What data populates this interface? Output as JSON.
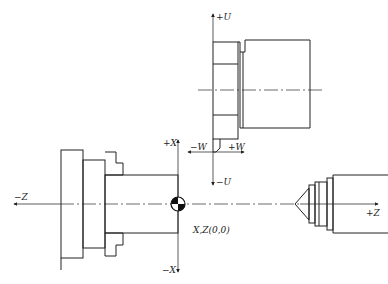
{
  "diagram": {
    "type": "lathe-coordinate-system",
    "components": [
      "chuck",
      "workpiece",
      "tool-post",
      "tailstock"
    ],
    "labels": {
      "plus_u": "+U",
      "minus_u": "−U",
      "plus_w": "+W",
      "minus_w": "−W",
      "plus_x": "+X",
      "minus_x": "−X",
      "plus_z": "+Z",
      "minus_z": "−Z",
      "origin": "X,Z(0,0)"
    },
    "colors": {
      "line": "#222222",
      "background": "#ffffff"
    }
  }
}
